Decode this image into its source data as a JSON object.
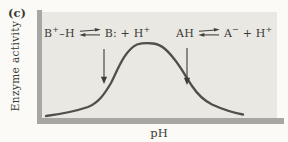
{
  "panel_label": "(c)",
  "axes": {
    "x_label": "pH",
    "y_label": "Enzyme activity"
  },
  "equations": [
    {
      "id": "base-group-equilibrium",
      "text": "B⁺–H ⇌ B: + H⁺",
      "parts": [
        {
          "text": "B"
        },
        {
          "text": "+",
          "sup": true
        },
        {
          "text": "–H"
        },
        {
          "harpoons": true
        },
        {
          "text": "B: + H"
        },
        {
          "text": "+",
          "sup": true
        }
      ]
    },
    {
      "id": "acid-group-equilibrium",
      "text": "AH ⇌ A⁻ + H⁺",
      "parts": [
        {
          "text": "AH"
        },
        {
          "harpoons": true
        },
        {
          "text": "A"
        },
        {
          "text": "−",
          "sup": true
        },
        {
          "text": " + H"
        },
        {
          "text": "+",
          "sup": true
        }
      ]
    }
  ],
  "colors": {
    "page_bg": "#fbfaf6",
    "plot_bg": "#e9e8e2",
    "axis_bar": "#a7a6a2",
    "curve": "#4f4f4b",
    "arrow": "#3d3d3a",
    "text": "#3a3a36"
  },
  "chart_data": {
    "type": "line",
    "title": "",
    "xlabel": "pH",
    "ylabel": "Enzyme activity",
    "panel": "(c)",
    "x_axis": {
      "ticks": [],
      "note": "qualitative, no tick labels shown"
    },
    "y_axis": {
      "ticks": [],
      "note": "qualitative, no tick labels shown"
    },
    "grid": false,
    "legend": "none",
    "series": [
      {
        "name": "Enzyme activity vs pH (bell-shaped optimum curve)",
        "points_normalized": [
          [
            0.02,
            0.03
          ],
          [
            0.12,
            0.07
          ],
          [
            0.2,
            0.15
          ],
          [
            0.26,
            0.3
          ],
          [
            0.3,
            0.47
          ],
          [
            0.34,
            0.7
          ],
          [
            0.38,
            0.9
          ],
          [
            0.42,
            0.99
          ],
          [
            0.46,
            1.0
          ],
          [
            0.5,
            0.99
          ],
          [
            0.54,
            0.92
          ],
          [
            0.58,
            0.78
          ],
          [
            0.62,
            0.56
          ],
          [
            0.66,
            0.37
          ],
          [
            0.7,
            0.23
          ],
          [
            0.75,
            0.13
          ],
          [
            0.81,
            0.07
          ],
          [
            0.86,
            0.04
          ]
        ]
      }
    ],
    "annotations": [
      {
        "text": "B⁺–H ⇌ B: + H⁺",
        "position": "upper-left",
        "arrow": "downward arrow to left inflection (pKa of basic group)"
      },
      {
        "text": "AH ⇌ A⁻ + H⁺",
        "position": "upper-right",
        "arrow": "downward arrow to right inflection (pKa of acidic group)"
      }
    ],
    "render": {
      "curve_path": "M46 116 C62 114, 76 111, 88 107 C98 103, 104 95, 111 83 C118 69, 125 50, 137 44.5 C142 43, 148 43, 153 43.5 C162 44.5, 168 51, 175 60 C182 69, 186 77, 192 86 C198 95, 204 100.5, 212 104.5 C222 109, 232 112.5, 243 114.5",
      "arrow_left_line": "M104 49 L104 78",
      "arrow_left_head": "104,84 100.9,76.8 107.1,76.8",
      "arrow_right_line": "M187 48 L187 79",
      "arrow_right_head": "187,85 183.9,77.8 190.1,77.8"
    }
  }
}
